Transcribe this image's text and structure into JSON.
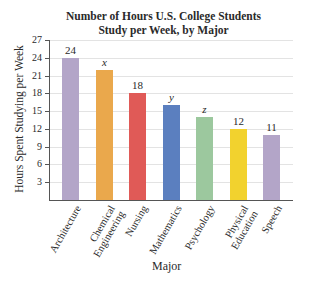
{
  "chart_data": {
    "type": "bar",
    "title_lines": [
      "Number of Hours U.S. College Students",
      "Study per Week, by Major"
    ],
    "xlabel": "Major",
    "ylabel": "Hours Spent Studying per Week",
    "categories": [
      "Architecture",
      "Chemical Engineering",
      "Nursing",
      "Mathematics",
      "Psychology",
      "Physical Education",
      "Speech"
    ],
    "category_lines": [
      [
        "Architecture"
      ],
      [
        "Chemical",
        "Engineering"
      ],
      [
        "Nursing"
      ],
      [
        "Mathematics"
      ],
      [
        "Psychology"
      ],
      [
        "Physical",
        "Education"
      ],
      [
        "Speech"
      ]
    ],
    "values": [
      24,
      22,
      18,
      16,
      14,
      12,
      11
    ],
    "value_labels": [
      "24",
      "x",
      "18",
      "y",
      "z",
      "12",
      "11"
    ],
    "colors": [
      "#b3a5c8",
      "#eaa84c",
      "#e05a57",
      "#5b7fbf",
      "#9cc89e",
      "#f2d22e",
      "#b3a5c8"
    ],
    "ylim": [
      0,
      27
    ],
    "yticks": [
      3,
      6,
      9,
      12,
      15,
      18,
      21,
      24,
      27
    ],
    "grid": true,
    "legend": null
  }
}
